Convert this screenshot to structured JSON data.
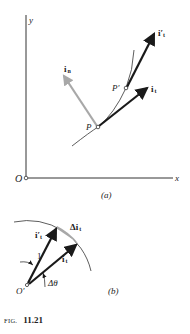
{
  "figure": {
    "caption_prefix": "FIG.",
    "caption_number": "11.21"
  },
  "part_a": {
    "label": "(a)",
    "axis_x_label": "x",
    "axis_y_label": "y",
    "origin_label": "O",
    "point_p_label": "P",
    "point_p_prime_label": "P′",
    "vector_it_label": "i",
    "vector_it_sub": "t",
    "vector_it_prime_label": "i′",
    "vector_it_prime_sub": "t",
    "vector_in_label": "i",
    "vector_in_sub": "n",
    "colors": {
      "ink": "#1a1a1a",
      "normal_vector": "#a8a8a8",
      "axes": "#333333"
    }
  },
  "part_b": {
    "label": "(b)",
    "origin_label": "O′",
    "vector_it_label": "i",
    "vector_it_sub": "t",
    "vector_it_prime_label": "i′",
    "vector_it_prime_sub": "t",
    "delta_label": "Δi",
    "delta_sub": "t",
    "radius_label": "1",
    "angle_label": "Δθ",
    "colors": {
      "ink": "#1a1a1a",
      "delta_fill": "#a8a8a8"
    }
  }
}
